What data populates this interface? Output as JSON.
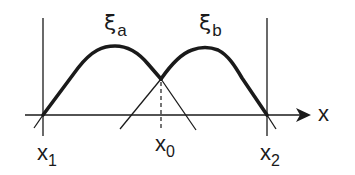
{
  "diagram": {
    "type": "membership-function-overlap",
    "curves": [
      {
        "id": "xi_a",
        "symbol": "ξ",
        "subscript": "a",
        "label": "ξa"
      },
      {
        "id": "xi_b",
        "symbol": "ξ",
        "subscript": "b",
        "label": "ξb"
      }
    ],
    "axis": {
      "label": "x"
    },
    "points": [
      {
        "id": "x1",
        "base": "x",
        "subscript": "1"
      },
      {
        "id": "x0",
        "base": "x",
        "subscript": "0"
      },
      {
        "id": "x2",
        "base": "x",
        "subscript": "2"
      }
    ],
    "colors": {
      "ink": "#1a1a1a",
      "background": "#ffffff"
    }
  }
}
